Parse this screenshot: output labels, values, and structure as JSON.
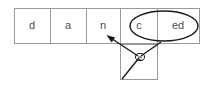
{
  "diagram": {
    "colors": {
      "border": "#9a9a9a",
      "annotation": "#1a1a1a",
      "text": "#4d4d4d",
      "background": "#ffffff"
    },
    "sequence_row": {
      "name": "top-cell-row",
      "cells": [
        {
          "id": "cell-d",
          "label": "d",
          "x": 14,
          "width": 36,
          "grouped": false
        },
        {
          "id": "cell-a",
          "label": "a",
          "x": 50,
          "width": 36,
          "grouped": false
        },
        {
          "id": "cell-n",
          "label": "n",
          "x": 86,
          "width": 34,
          "grouped": false
        },
        {
          "id": "cell-c",
          "label": "c",
          "x": 120,
          "width": 38,
          "grouped": true
        },
        {
          "id": "cell-ed",
          "label": "ed",
          "x": 158,
          "width": 42,
          "grouped": true
        }
      ],
      "top": 8,
      "height": 36
    },
    "lower_cell": {
      "name": "lower-cell",
      "label": "e",
      "x": 120,
      "y": 44,
      "width": 38,
      "height": 36
    },
    "grouping_ellipse": {
      "name": "grouping-ellipse",
      "cx": 164,
      "cy": 26,
      "rx": 34,
      "ry": 15,
      "covers": [
        "c",
        "ed"
      ]
    },
    "marker_ellipse": {
      "name": "marker-ellipse",
      "cx": 140,
      "cy": 57,
      "rx": 4.5,
      "ry": 3.5
    },
    "connectors": [
      {
        "id": "connector-to-n",
        "from_label": "e",
        "to_label": "n",
        "x1": 140,
        "y1": 57,
        "x2": 108,
        "y2": 36,
        "arrow": true
      },
      {
        "id": "connector-from-ed",
        "from_label": "ed",
        "to_label": "e",
        "x1": 160,
        "y1": 42,
        "x2": 140,
        "y2": 57,
        "arrow": false
      },
      {
        "id": "connector-from-corner",
        "from_label": "lower-left-corner",
        "to_label": "e",
        "x1": 122,
        "y1": 79,
        "x2": 140,
        "y2": 57,
        "arrow": false
      }
    ]
  }
}
